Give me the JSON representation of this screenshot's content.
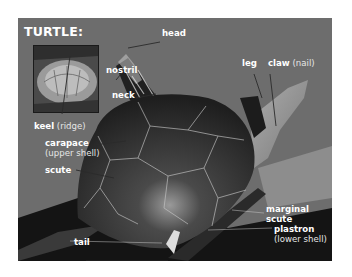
{
  "figure": {
    "title": "TURTLE:",
    "background_color": "#6d6d6d",
    "label_color": "#ffffff",
    "labels": {
      "head": {
        "term": "head"
      },
      "nostril": {
        "term": "nostril"
      },
      "neck": {
        "term": "neck"
      },
      "leg": {
        "term": "leg"
      },
      "claw": {
        "term": "claw",
        "note": "(nail)"
      },
      "keel": {
        "term": "keel",
        "note": "(ridge)"
      },
      "carapace": {
        "term": "carapace",
        "note": "(upper shell)"
      },
      "scute": {
        "term": "scute"
      },
      "marginal_scute": {
        "term": "marginal",
        "term2": "scute"
      },
      "plastron": {
        "term": "plastron",
        "note": "(lower shell)"
      },
      "tail": {
        "term": "tail"
      }
    },
    "inset": {
      "description": "close-up of shell showing keel"
    }
  }
}
